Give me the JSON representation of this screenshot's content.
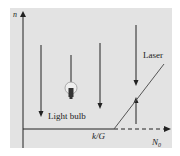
{
  "diagram": {
    "y_axis_label": "n",
    "x_axis_threshold_label": "k/G",
    "x_axis_label": "N",
    "x_axis_label_subscript": "0",
    "light_bulb_label": "Light bulb",
    "laser_label": "Laser",
    "colors": {
      "panel_background": "#e3e3e3",
      "page_background": "#ffffff",
      "line": "#222222",
      "laser_line": "#555555"
    }
  }
}
